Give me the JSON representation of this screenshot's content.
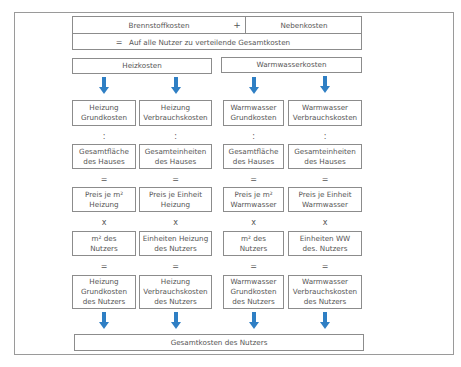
{
  "top": {
    "brennstoff": "Brennstoffkosten",
    "plus": "+",
    "neben": "Nebenkosten",
    "equals": "=",
    "gesamt": "Auf alle Nutzer zu verteilende Gesamtkosten"
  },
  "split": {
    "heiz": "Heizkosten",
    "warm": "Warmwasserkosten"
  },
  "columns": [
    {
      "r1": "Heizung\nGrundkosten",
      "op1": ":",
      "r2": "Gesamtfläche\ndes Hauses",
      "op2": "=",
      "r3": "Preis je m²\nHeizung",
      "op3": "x",
      "r4": "m² des\nNutzers",
      "op4": "=",
      "r5": "Heizung\nGrundkosten\ndes Nutzers"
    },
    {
      "r1": "Heizung\nVerbrauchskosten",
      "op1": ":",
      "r2": "Gesamteinheiten\ndes Hauses",
      "op2": "=",
      "r3": "Preis je Einheit\nHeizung",
      "op3": "x",
      "r4": "Einheiten Heizung\ndes Nutzers",
      "op4": "=",
      "r5": "Heizung\nVerbrauchskosten\ndes Nutzers"
    },
    {
      "r1": "Warmwasser\nGrundkosten",
      "op1": ":",
      "r2": "Gesamtfläche\ndes Hauses",
      "op2": "=",
      "r3": "Preis je m²\nWarmwasser",
      "op3": "x",
      "r4": "m² des\nNutzers",
      "op4": "=",
      "r5": "Warmwasser\nGrundkosten\ndes Nutzers"
    },
    {
      "r1": "Warmwasser\nVerbrauchskosten",
      "op1": ":",
      "r2": "Gesamteinheiten\ndes Hauses",
      "op2": "=",
      "r3": "Preis je Einheit\nWarmwasser",
      "op3": "x",
      "r4": "Einheiten WW\ndes. Nutzers",
      "op4": "=",
      "r5": "Warmwasser\nVerbrauchskosten\ndes Nutzers"
    }
  ],
  "final": "Gesamtkosten des Nutzers",
  "colors": {
    "arrow": "#2f7fc4",
    "border": "#8c8c8c",
    "text": "#555555"
  }
}
